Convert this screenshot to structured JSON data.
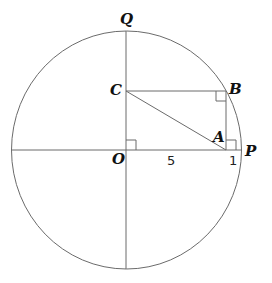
{
  "diagram": {
    "type": "geometry",
    "points": {
      "Q": {
        "label": "Q"
      },
      "C": {
        "label": "C"
      },
      "B": {
        "label": "B"
      },
      "A": {
        "label": "A"
      },
      "O": {
        "label": "O"
      },
      "P": {
        "label": "P"
      }
    },
    "segment_labels": {
      "OA": "5",
      "AP": "1"
    },
    "right_angles": [
      "AOC",
      "CBA",
      "BAP"
    ],
    "colors": {
      "stroke": "#6b6b6b",
      "text": "#111111",
      "background": "#ffffff"
    }
  }
}
